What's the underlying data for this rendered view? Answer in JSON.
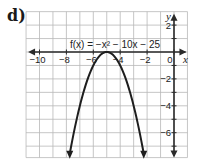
{
  "part_label": "d)",
  "chart_data": {
    "type": "line",
    "title": "",
    "function_label": "f(x) = −x² − 10x − 25",
    "function": "-x^2 - 10x - 25",
    "vertex": [
      -5,
      0
    ],
    "xlabel": "x",
    "ylabel": "y",
    "xlim": [
      -11,
      1
    ],
    "ylim": [
      -8,
      3
    ],
    "grid": true,
    "x_ticks": [
      -10,
      -8,
      -6,
      -4,
      -2,
      0
    ],
    "x_tick_labels": [
      "−10",
      "−8",
      "−6",
      "−4",
      "−2",
      "0"
    ],
    "y_ticks": [
      2,
      -2,
      -4,
      -6
    ],
    "y_tick_labels": [
      "2",
      "−2",
      "−4",
      "−6"
    ],
    "series": [
      {
        "name": "f(x)",
        "x": [
          -7.8,
          -7.5,
          -7,
          -6.5,
          -6,
          -5.5,
          -5,
          -4.5,
          -4,
          -3.5,
          -3,
          -2.5,
          -2.2
        ],
        "y": [
          -7.84,
          -6.25,
          -4,
          -2.25,
          -1,
          -0.25,
          0,
          -0.25,
          -1,
          -2.25,
          -4,
          -6.25,
          -7.84
        ]
      }
    ]
  },
  "colors": {
    "grid": "#b8b8b8",
    "axis": "#2a2a2a",
    "curve": "#1e1e1e"
  }
}
